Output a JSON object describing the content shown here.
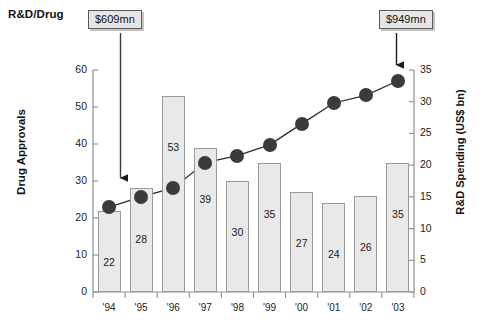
{
  "chart_data": {
    "type": "bar",
    "title": "R&D/Drug",
    "xlabel": "",
    "ylabel": "Drug Approvals",
    "ylabel_secondary": "R&D Spending (US$ bn)",
    "categories": [
      "'94",
      "'95",
      "'96",
      "'97",
      "'98",
      "'99",
      "'00",
      "'01",
      "'02",
      "'03"
    ],
    "ylim": [
      0,
      60
    ],
    "ylim_secondary": [
      0,
      35
    ],
    "yticks": [
      0,
      10,
      20,
      30,
      40,
      50,
      60
    ],
    "yticks_secondary": [
      0,
      5,
      10,
      15,
      20,
      25,
      30,
      35
    ],
    "grid": false,
    "legend": "none",
    "series": [
      {
        "name": "Drug Approvals",
        "type": "bar",
        "axis": "left",
        "values": [
          22,
          28,
          53,
          39,
          30,
          35,
          27,
          24,
          26,
          35
        ]
      },
      {
        "name": "R&D Spending (US$ bn)",
        "type": "line",
        "axis": "right",
        "values": [
          13.4,
          15.0,
          16.4,
          20.4,
          21.5,
          23.2,
          26.5,
          29.8,
          31.0,
          33.3
        ]
      }
    ],
    "annotations": [
      {
        "label": "$609mn",
        "target_category": "'94",
        "target_series": "R&D Spending (US$ bn)"
      },
      {
        "label": "$949mn",
        "target_category": "'03",
        "target_series": "R&D Spending (US$ bn)"
      }
    ]
  },
  "axis": {
    "left_label": "Drug Approvals",
    "right_label": "R&D Spending (US$ bn)",
    "left_ticks": [
      "0",
      "10",
      "20",
      "30",
      "40",
      "50",
      "60"
    ],
    "right_ticks": [
      "0",
      "5",
      "10",
      "15",
      "20",
      "25",
      "30",
      "35"
    ],
    "x_ticks": [
      "'94",
      "'95",
      "'96",
      "'97",
      "'98",
      "'99",
      "'00",
      "'01",
      "'02",
      "'03"
    ]
  },
  "header": {
    "title": "R&D/Drug"
  },
  "callouts": {
    "left": "$609mn",
    "right": "$949mn"
  },
  "bar_values": [
    "22",
    "28",
    "53",
    "39",
    "30",
    "35",
    "27",
    "24",
    "26",
    "35"
  ],
  "colors": {
    "bar_fill": "#e9e9e9",
    "bar_stroke": "#9a9a9a",
    "marker": "#3b3b3b",
    "line": "#2b2b2b",
    "axis": "#8d8d8d",
    "callout_bg": "#e6e6e6",
    "text": "#1a1a1a"
  }
}
